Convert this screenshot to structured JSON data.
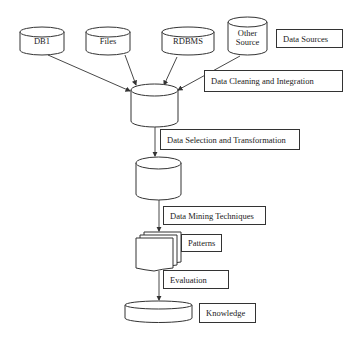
{
  "diagram": {
    "sources": [
      {
        "id": "db1",
        "label": "DB1"
      },
      {
        "id": "files",
        "label": "Files"
      },
      {
        "id": "rdbms",
        "label": "RDBMS"
      },
      {
        "id": "other",
        "label_line1": "Other",
        "label_line2": "Source"
      }
    ],
    "steps": {
      "data_sources": "Data Sources",
      "cleaning": "Data Cleaning and Integration",
      "selection": "Data Selection and Transformation",
      "mining": "Data Mining Techniques",
      "patterns": "Patterns",
      "evaluation": "Evaluation",
      "knowledge": "Knowledge"
    },
    "colors": {
      "stroke": "#333333",
      "background": "#ffffff",
      "text": "#222222"
    }
  }
}
